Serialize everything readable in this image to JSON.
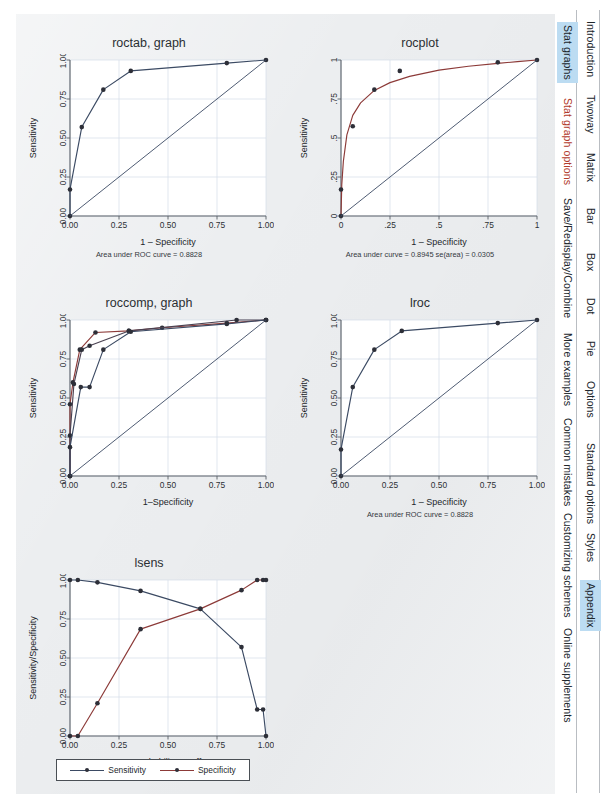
{
  "page": {
    "background_color": "#eceef0",
    "highlight_color": "#bcdcf2"
  },
  "colors": {
    "navy": "#3b4a63",
    "maroon": "#8c3a38",
    "axis": "#5a6068",
    "grid": "#d4dde8",
    "marker_dark": "#2d2f38"
  },
  "sidebar": {
    "inner_tabs": [
      {
        "label": "Stat graphs",
        "selected": true,
        "accent": false
      },
      {
        "label": "Stat graph options",
        "selected": false,
        "accent": true
      },
      {
        "label": "Save/Redisplay/Combine",
        "selected": false,
        "accent": false
      },
      {
        "label": "More examples",
        "selected": false,
        "accent": false
      },
      {
        "label": "Common mistakes",
        "selected": false,
        "accent": false
      },
      {
        "label": "Customizing schemes",
        "selected": false,
        "accent": false
      },
      {
        "label": "Online supplements",
        "selected": false,
        "accent": false
      }
    ],
    "outer_tabs": [
      {
        "label": "Introduction",
        "selected": false
      },
      {
        "label": "Twoway",
        "selected": false
      },
      {
        "label": "Matrix",
        "selected": false
      },
      {
        "label": "Bar",
        "selected": false
      },
      {
        "label": "Box",
        "selected": false
      },
      {
        "label": "Dot",
        "selected": false
      },
      {
        "label": "Pie",
        "selected": false
      },
      {
        "label": "Options",
        "selected": false
      },
      {
        "label": "Standard options",
        "selected": false
      },
      {
        "label": "Styles",
        "selected": false
      },
      {
        "label": "Appendix",
        "selected": true
      }
    ]
  },
  "chart_data": [
    {
      "id": "roctab",
      "type": "line",
      "title": "roctab, graph",
      "xlabel": "1 – Specificity",
      "ylabel": "Sensitivity",
      "caption": "Area under ROC curve = 0.8828",
      "xlim": [
        0,
        1
      ],
      "ylim": [
        0,
        1
      ],
      "xticks": [
        "0.00",
        "0.25",
        "0.50",
        "0.75",
        "1.00"
      ],
      "yticks": [
        "0.00",
        "0.25",
        "0.50",
        "0.75",
        "1.00"
      ],
      "grid": true,
      "series": [
        {
          "name": "ROC curve",
          "color": "#3b4a63",
          "markers": true,
          "x": [
            0,
            0,
            0.06,
            0.17,
            0.31,
            0.8,
            1.0
          ],
          "y": [
            0,
            0.17,
            0.57,
            0.81,
            0.93,
            0.98,
            1.0
          ]
        },
        {
          "name": "Reference",
          "color": "#3b4a63",
          "markers": false,
          "x": [
            0,
            1
          ],
          "y": [
            0,
            1
          ]
        }
      ]
    },
    {
      "id": "rocplot",
      "type": "line",
      "title": "rocplot",
      "xlabel": "1 – Specificity",
      "ylabel": "Sensitivity",
      "caption": "Area under curve = 0.8945   se(area) = 0.0305",
      "xlim": [
        0,
        1
      ],
      "ylim": [
        0,
        1
      ],
      "xticks": [
        "0",
        ".25",
        ".5",
        ".75",
        "1"
      ],
      "yticks": [
        "0",
        ".25",
        ".5",
        ".75",
        "1"
      ],
      "grid": true,
      "series": [
        {
          "name": "Fitted ROC",
          "color": "#8c3a38",
          "markers": false,
          "x": [
            0,
            0.004,
            0.012,
            0.03,
            0.06,
            0.1,
            0.17,
            0.25,
            0.35,
            0.5,
            0.65,
            0.8,
            0.9,
            1.0
          ],
          "y": [
            0,
            0.2,
            0.35,
            0.52,
            0.645,
            0.725,
            0.805,
            0.855,
            0.895,
            0.935,
            0.96,
            0.978,
            0.99,
            1.0
          ]
        },
        {
          "name": "Observed points",
          "color": "#3b4a63",
          "markers": true,
          "points_only": true,
          "x": [
            0,
            0,
            0.06,
            0.17,
            0.3,
            0.8,
            1.0
          ],
          "y": [
            0,
            0.17,
            0.575,
            0.81,
            0.93,
            0.985,
            1.0
          ]
        },
        {
          "name": "Reference",
          "color": "#3b4a63",
          "markers": false,
          "x": [
            0,
            1
          ],
          "y": [
            0,
            1
          ]
        }
      ]
    },
    {
      "id": "roccomp",
      "type": "line",
      "title": "roccomp, graph",
      "xlabel": "1–Specificity",
      "ylabel": "Sensitivity",
      "caption": "",
      "xlim": [
        0,
        1
      ],
      "ylim": [
        0,
        1
      ],
      "xticks": [
        "0.00",
        "0.25",
        "0.50",
        "0.75",
        "1.00"
      ],
      "yticks": [
        "0.00",
        "0.25",
        "0.50",
        "0.75",
        "1.00"
      ],
      "grid": true,
      "series": [
        {
          "name": "Curve 1",
          "color": "#8c3a38",
          "markers": true,
          "x": [
            0,
            0,
            0.015,
            0.05,
            0.13,
            0.3,
            0.47,
            0.8,
            1.0
          ],
          "y": [
            0,
            0.46,
            0.6,
            0.81,
            0.92,
            0.93,
            0.95,
            0.98,
            1.0
          ]
        },
        {
          "name": "Curve 2",
          "color": "#4a4252",
          "markers": true,
          "x": [
            0,
            0,
            0.02,
            0.06,
            0.1,
            0.3,
            0.85,
            1.0
          ],
          "y": [
            0,
            0.26,
            0.59,
            0.81,
            0.835,
            0.93,
            1.0,
            1.0
          ]
        },
        {
          "name": "Curve 3",
          "color": "#3b4a63",
          "markers": true,
          "x": [
            0,
            0,
            0.055,
            0.1,
            0.17,
            0.31,
            0.8,
            1.0
          ],
          "y": [
            0,
            0.185,
            0.57,
            0.57,
            0.81,
            0.925,
            0.975,
            1.0
          ]
        },
        {
          "name": "Reference",
          "color": "#3b4a63",
          "markers": false,
          "x": [
            0,
            1
          ],
          "y": [
            0,
            1
          ]
        }
      ]
    },
    {
      "id": "lroc",
      "type": "line",
      "title": "lroc",
      "xlabel": "1 – Specificity",
      "ylabel": "Sensitivity",
      "caption": "Area under ROC curve = 0.8828",
      "xlim": [
        0,
        1
      ],
      "ylim": [
        0,
        1
      ],
      "xticks": [
        "0.00",
        "0.25",
        "0.50",
        "0.75",
        "1.00"
      ],
      "yticks": [
        "0.00",
        "0.25",
        "0.50",
        "0.75",
        "1.00"
      ],
      "grid": true,
      "series": [
        {
          "name": "ROC curve",
          "color": "#3b4a63",
          "markers": true,
          "x": [
            0,
            0,
            0.06,
            0.17,
            0.31,
            0.8,
            1.0
          ],
          "y": [
            0,
            0.17,
            0.57,
            0.81,
            0.93,
            0.98,
            1.0
          ]
        },
        {
          "name": "Reference",
          "color": "#3b4a63",
          "markers": false,
          "x": [
            0,
            1
          ],
          "y": [
            0,
            1
          ]
        }
      ]
    },
    {
      "id": "lsens",
      "type": "line",
      "title": "lsens",
      "xlabel": "Probability cutoff",
      "ylabel": "Sensitivity/Specificity",
      "caption": "",
      "xlim": [
        0,
        1
      ],
      "ylim": [
        0,
        1
      ],
      "xticks": [
        "0.00",
        "0.25",
        "0.50",
        "0.75",
        "1.00"
      ],
      "yticks": [
        "0.00",
        "0.25",
        "0.50",
        "0.75",
        "1.00"
      ],
      "grid": true,
      "legend": [
        {
          "label": "Sensitivity",
          "color": "#3b4a63"
        },
        {
          "label": "Specificity",
          "color": "#8c3a38"
        }
      ],
      "series": [
        {
          "name": "Sensitivity",
          "color": "#3b4a63",
          "markers": true,
          "x": [
            0.0,
            0.04,
            0.14,
            0.36,
            0.665,
            0.875,
            0.955,
            0.985,
            1.0
          ],
          "y": [
            1.0,
            1.0,
            0.985,
            0.93,
            0.815,
            0.57,
            0.17,
            0.17,
            0.0
          ]
        },
        {
          "name": "Specificity",
          "color": "#8c3a38",
          "markers": true,
          "x": [
            0.0,
            0.04,
            0.14,
            0.36,
            0.665,
            0.875,
            0.955,
            0.985,
            1.0
          ],
          "y": [
            0.0,
            0.0,
            0.21,
            0.685,
            0.815,
            0.935,
            1.0,
            1.0,
            1.0
          ]
        }
      ]
    }
  ]
}
